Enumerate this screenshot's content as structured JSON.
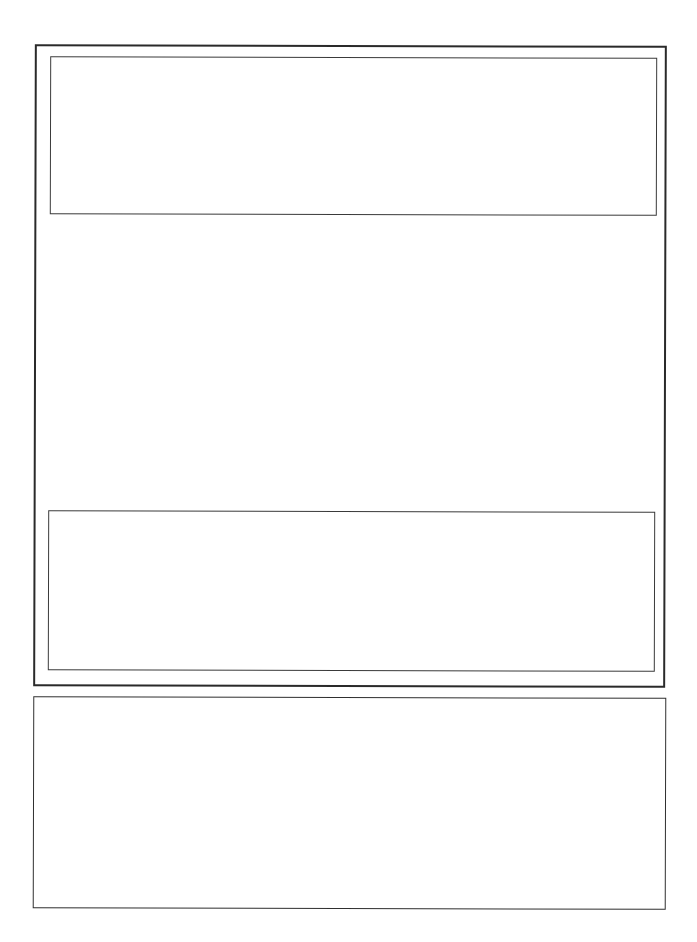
{
  "document": {
    "type": "blank form",
    "frames": [
      {
        "id": "outer-frame",
        "content": ""
      },
      {
        "id": "top-box",
        "content": ""
      },
      {
        "id": "middle-box",
        "content": ""
      },
      {
        "id": "bottom-box",
        "content": ""
      }
    ]
  },
  "colors": {
    "background": "#ffffff",
    "border": "#2a2a2a"
  }
}
